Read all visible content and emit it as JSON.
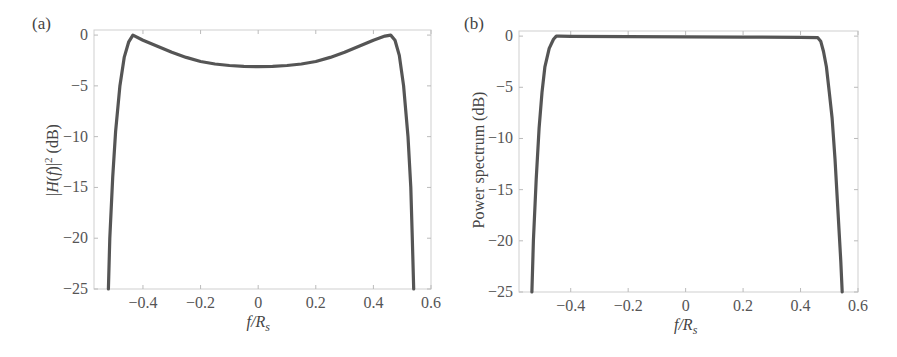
{
  "chart_data": [
    {
      "type": "line",
      "panel_label": "(a)",
      "title": "",
      "xlabel": "f/R_s",
      "xlabel_parts": {
        "f": "f",
        "slash": "/",
        "R": "R",
        "sub": "s"
      },
      "ylabel": "|H(f)|^2 (dB)",
      "xlim": [
        -0.57,
        0.6
      ],
      "ylim": [
        -25,
        0.5
      ],
      "x_ticks": [
        -0.4,
        -0.2,
        0,
        0.2,
        0.4,
        0.6
      ],
      "x_tick_labels": [
        "−0.4",
        "−0.2",
        "0",
        "0.2",
        "0.4",
        "0.6"
      ],
      "y_ticks": [
        0,
        -5,
        -10,
        -15,
        -20,
        -25
      ],
      "y_tick_labels": [
        "0",
        "−5",
        "−10",
        "−15",
        "−20",
        "−25"
      ],
      "grid": false,
      "series": [
        {
          "name": "|H(f)|^2",
          "x": [
            -0.52,
            -0.515,
            -0.505,
            -0.495,
            -0.48,
            -0.465,
            -0.45,
            -0.435,
            -0.4,
            -0.35,
            -0.3,
            -0.25,
            -0.2,
            -0.15,
            -0.1,
            -0.05,
            0,
            0.05,
            0.1,
            0.15,
            0.2,
            0.25,
            0.3,
            0.35,
            0.4,
            0.44,
            0.46,
            0.475,
            0.49,
            0.505,
            0.52,
            0.53,
            0.535,
            0.54
          ],
          "y": [
            -25,
            -20,
            -14,
            -9.5,
            -5,
            -2.2,
            -0.7,
            0,
            -0.5,
            -1.1,
            -1.7,
            -2.2,
            -2.6,
            -2.85,
            -3.0,
            -3.08,
            -3.1,
            -3.08,
            -3.0,
            -2.85,
            -2.6,
            -2.2,
            -1.7,
            -1.1,
            -0.5,
            -0.1,
            0,
            -0.5,
            -2.0,
            -5.0,
            -10,
            -15,
            -20,
            -25
          ]
        }
      ]
    },
    {
      "type": "line",
      "panel_label": "(b)",
      "title": "",
      "xlabel": "f/R_s",
      "xlabel_parts": {
        "f": "f",
        "slash": "/",
        "R": "R",
        "sub": "s"
      },
      "ylabel": "Power spectrum (dB)",
      "xlim": [
        -0.58,
        0.6
      ],
      "ylim": [
        -25,
        0.5
      ],
      "x_ticks": [
        -0.4,
        -0.2,
        0,
        0.2,
        0.4,
        0.6
      ],
      "x_tick_labels": [
        "−0.4",
        "−0.2",
        "0",
        "0.2",
        "0.4",
        "0.6"
      ],
      "y_ticks": [
        0,
        -5,
        -10,
        -15,
        -20,
        -25
      ],
      "y_tick_labels": [
        "0",
        "−5",
        "−10",
        "−15",
        "−20",
        "−25"
      ],
      "grid": false,
      "series": [
        {
          "name": "Power spectrum",
          "x": [
            -0.535,
            -0.53,
            -0.52,
            -0.51,
            -0.5,
            -0.49,
            -0.475,
            -0.46,
            -0.45,
            -0.44,
            -0.4,
            -0.2,
            0,
            0.2,
            0.4,
            0.46,
            0.47,
            0.48,
            0.49,
            0.5,
            0.51,
            0.52,
            0.53,
            0.54,
            0.545
          ],
          "y": [
            -25,
            -20,
            -14,
            -9,
            -5.5,
            -3,
            -1.2,
            -0.3,
            0,
            0,
            -0.02,
            -0.05,
            -0.07,
            -0.1,
            -0.12,
            -0.15,
            -0.5,
            -1.5,
            -3,
            -5.5,
            -8,
            -12,
            -17,
            -22,
            -25
          ]
        }
      ]
    }
  ]
}
